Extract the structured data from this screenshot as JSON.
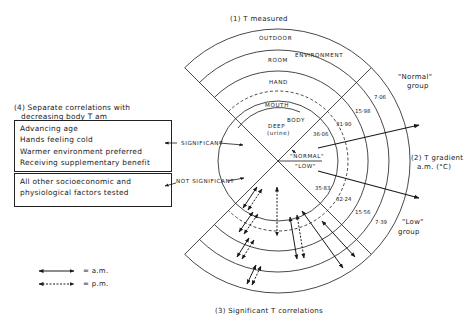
{
  "title_measured": "(1) T measured",
  "title_gradient": [
    "(2) T gradient",
    "a.m. (°C)"
  ],
  "title_correlations": "(3) Significant T correlations",
  "section4": {
    "title_line1": "(4) Separate correlations with",
    "title_line2": "decreasing body T am",
    "significant_box": [
      "Advancing age",
      "Hands feeling cold",
      "Warmer environment preferred",
      "Receiving supplementary benefit"
    ],
    "not_significant_box": [
      "All other socioeconomic and",
      "physiological factors tested"
    ],
    "significant_label": "SIGNIFICANT",
    "not_significant_label": "NOT SIGNIFICANT"
  },
  "rings": {
    "outdoor": "OUTDOOR",
    "room": "ROOM",
    "environment": "ENVIRONMENT",
    "hand": "HAND",
    "mouth": "MOUTH",
    "body": "BODY",
    "deep": "DEEP",
    "urine": "(urine)"
  },
  "groups": {
    "normal_label": "\"NORMAL\"",
    "low_label": "\"LOW\"",
    "normal_group": [
      "\"Normal\"",
      "group"
    ],
    "low_group": [
      "\"Low\"",
      "group"
    ]
  },
  "gradient_values": {
    "normal": [
      "36·06",
      "31·90",
      "15·98",
      "7·06"
    ],
    "low": [
      "35·83",
      "32·24",
      "15·56",
      "7·39"
    ]
  },
  "legend": {
    "am_label": "= a.m.",
    "pm_label": "= p.m."
  }
}
